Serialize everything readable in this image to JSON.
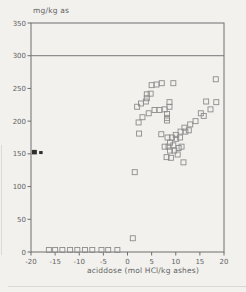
{
  "chart_data": {
    "type": "scatter",
    "title": "mg/kg as",
    "xlabel": "aciddose (mol HCl/kg ashes)",
    "ylabel": "",
    "xlim": [
      -20,
      20
    ],
    "ylim": [
      0,
      350
    ],
    "xticks": [
      -20,
      -15,
      -10,
      -5,
      0,
      5,
      10,
      15,
      20
    ],
    "yticks": [
      0,
      50,
      100,
      150,
      200,
      250,
      300,
      350
    ],
    "reference_line_y": 300,
    "grid": false,
    "legend": "none",
    "marker": "open-square",
    "points": [
      [
        -16.3,
        3
      ],
      [
        -15.0,
        3
      ],
      [
        -13.5,
        3
      ],
      [
        -11.9,
        3
      ],
      [
        -10.4,
        3
      ],
      [
        -8.8,
        3
      ],
      [
        -7.3,
        3
      ],
      [
        -5.4,
        3
      ],
      [
        -4.0,
        3
      ],
      [
        -2.1,
        3
      ],
      [
        1.1,
        21
      ],
      [
        1.5,
        122
      ],
      [
        2.0,
        222
      ],
      [
        2.3,
        198
      ],
      [
        2.4,
        181
      ],
      [
        2.8,
        227
      ],
      [
        3.1,
        206
      ],
      [
        3.8,
        230
      ],
      [
        4.0,
        241
      ],
      [
        4.0,
        235
      ],
      [
        4.4,
        212
      ],
      [
        4.8,
        242
      ],
      [
        5.0,
        255
      ],
      [
        5.6,
        217
      ],
      [
        6.0,
        256
      ],
      [
        6.6,
        217
      ],
      [
        7.0,
        180
      ],
      [
        7.1,
        258
      ],
      [
        7.7,
        218
      ],
      [
        7.7,
        161
      ],
      [
        8.1,
        145
      ],
      [
        8.2,
        211
      ],
      [
        8.2,
        205
      ],
      [
        8.2,
        201
      ],
      [
        8.3,
        175
      ],
      [
        8.5,
        161
      ],
      [
        8.7,
        229
      ],
      [
        8.7,
        222
      ],
      [
        8.8,
        167
      ],
      [
        8.8,
        155
      ],
      [
        9.0,
        144
      ],
      [
        9.2,
        175
      ],
      [
        9.5,
        258
      ],
      [
        9.5,
        163
      ],
      [
        9.7,
        155
      ],
      [
        10.0,
        179
      ],
      [
        10.1,
        173
      ],
      [
        10.4,
        149
      ],
      [
        10.6,
        159
      ],
      [
        10.9,
        175
      ],
      [
        11.0,
        184
      ],
      [
        11.2,
        161
      ],
      [
        11.6,
        137
      ],
      [
        11.8,
        190
      ],
      [
        12.0,
        184
      ],
      [
        12.7,
        186
      ],
      [
        13.0,
        195
      ],
      [
        14.1,
        200
      ],
      [
        15.2,
        212
      ],
      [
        15.8,
        208
      ],
      [
        16.3,
        230
      ],
      [
        17.2,
        218
      ],
      [
        18.3,
        264
      ],
      [
        18.4,
        229
      ]
    ],
    "offscale_markers": [
      {
        "x": -19.3,
        "y": 153,
        "shape": "filled-square"
      },
      {
        "x": -18.0,
        "y": 152,
        "shape": "small-filled-tick"
      }
    ],
    "colors": {
      "axis": "#6e6e6e",
      "marker_stroke": "#8c8c8c",
      "text": "#636363",
      "reference_line": "#767676",
      "special_marker": "#2f2f2f",
      "background": "#f2f1ee"
    }
  }
}
